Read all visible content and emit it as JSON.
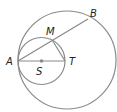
{
  "diagram": {
    "colors": {
      "stroke": "#8a8a8a",
      "text": "#222222",
      "point": "#8a8a8a"
    },
    "labels": {
      "A": "A",
      "B": "B",
      "M": "M",
      "S": "S",
      "T": "T"
    },
    "shapes": {
      "large_circle": {
        "cx": 67,
        "cy": 60,
        "r": 49
      },
      "small_circle": {
        "cx": 41.5,
        "cy": 61,
        "r": 23.5
      },
      "chord_AB": {
        "from": "A",
        "to": "B"
      },
      "segment_AT": {
        "from": "A",
        "to": "T"
      },
      "segment_MT": {
        "from": "M",
        "to": "T"
      },
      "center_point_S": {
        "x": 41.5,
        "y": 61
      }
    }
  }
}
